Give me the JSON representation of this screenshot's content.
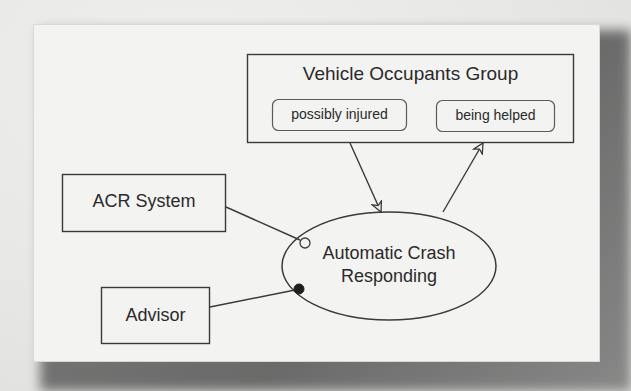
{
  "diagram": {
    "type": "use-case / scenario diagram",
    "group": {
      "title": "Vehicle Occupants Group",
      "states": [
        {
          "label": "possibly injured"
        },
        {
          "label": "being helped"
        }
      ]
    },
    "actors": [
      {
        "label": "ACR System",
        "connector": "open-circle"
      },
      {
        "label": "Advisor",
        "connector": "filled-circle"
      }
    ],
    "use_case": {
      "line1": "Automatic Crash",
      "line2": "Responding"
    },
    "edges": [
      {
        "from": "possibly injured",
        "to": "Automatic Crash Responding",
        "arrow": "open-triangle"
      },
      {
        "from": "Automatic Crash Responding",
        "to": "being helped",
        "arrow": "open-triangle"
      },
      {
        "from": "ACR System",
        "to": "Automatic Crash Responding",
        "end": "open-circle"
      },
      {
        "from": "Advisor",
        "to": "Automatic Crash Responding",
        "end": "filled-circle"
      }
    ],
    "colors": {
      "stroke": "#3a3a3a",
      "text": "#2a2a2a",
      "paper": "#f3f3f1",
      "shadow": "#5a5a5a"
    }
  }
}
